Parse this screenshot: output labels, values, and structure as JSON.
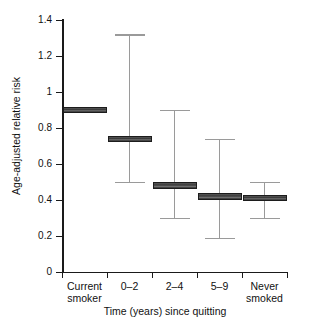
{
  "chart_data": {
    "type": "bar",
    "title": "",
    "xlabel": "Time (years) since quitting",
    "ylabel": "Age-adjusted relative risk",
    "ylim": [
      0,
      1.4
    ],
    "yticks": [
      "0",
      "0.2",
      "0.4",
      "0.6",
      "0.8",
      "1",
      "1.2",
      "1.4"
    ],
    "ytick_values": [
      0,
      0.2,
      0.4,
      0.6,
      0.8,
      1.0,
      1.2,
      1.4
    ],
    "grid": false,
    "legend": "none",
    "categories": [
      "Current smoker",
      "0–2",
      "2–4",
      "5–9",
      "Never smoked"
    ],
    "category_lines": [
      [
        "Current",
        "smoker"
      ],
      [
        "0–2",
        ""
      ],
      [
        "2–4",
        ""
      ],
      [
        "5–9",
        ""
      ],
      [
        "Never",
        "smoked"
      ]
    ],
    "values": [
      0.9,
      0.74,
      0.48,
      0.42,
      0.41
    ],
    "ci_lower": [
      null,
      0.5,
      0.3,
      0.19,
      0.3
    ],
    "ci_upper": [
      null,
      1.32,
      0.9,
      0.74,
      0.5
    ],
    "series": [
      {
        "name": "Age-adjusted relative risk",
        "points": [
          {
            "category": "Current smoker",
            "value": 0.9,
            "lower": null,
            "upper": null
          },
          {
            "category": "0–2",
            "value": 0.74,
            "lower": 0.5,
            "upper": 1.32
          },
          {
            "category": "2–4",
            "value": 0.48,
            "lower": 0.3,
            "upper": 0.9
          },
          {
            "category": "5–9",
            "value": 0.42,
            "lower": 0.19,
            "upper": 0.74
          },
          {
            "category": "Never smoked",
            "value": 0.41,
            "lower": 0.3,
            "upper": 0.5
          }
        ]
      }
    ],
    "colors": {
      "box_fill": "#3a3a3a",
      "box_edge": "#1c1c1c",
      "whisker": "#9a9a9a",
      "axis": "#1a1a1a",
      "background": "#ffffff"
    }
  }
}
